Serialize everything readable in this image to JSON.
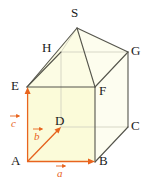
{
  "figure": {
    "colors": {
      "face_fill": "#fbfbdc",
      "face_fill_light": "#fdfdef",
      "edge_dark": "#4a4a42",
      "edge_hidden": "#cfcfc0",
      "vector": "#e8641e",
      "vector_edge": "#e0701c",
      "label": "#1a1a1a",
      "background": "#ffffff"
    },
    "vertices": [
      {
        "name": "A",
        "x": 27,
        "y": 162,
        "label_x": 11,
        "label_y": 155,
        "hidden": false
      },
      {
        "name": "B",
        "x": 95,
        "y": 162,
        "label_x": 99,
        "label_y": 155,
        "hidden": false
      },
      {
        "name": "C",
        "x": 128,
        "y": 127,
        "label_x": 131,
        "label_y": 120,
        "hidden": false
      },
      {
        "name": "D",
        "x": 61,
        "y": 127,
        "label_x": 55,
        "label_y": 116,
        "hidden": true
      },
      {
        "name": "E",
        "x": 27,
        "y": 87,
        "label_x": 11,
        "label_y": 80,
        "hidden": false
      },
      {
        "name": "F",
        "x": 95,
        "y": 87,
        "label_x": 99,
        "label_y": 85,
        "hidden": false
      },
      {
        "name": "G",
        "x": 128,
        "y": 52,
        "label_x": 131,
        "label_y": 45,
        "hidden": false
      },
      {
        "name": "H",
        "x": 61,
        "y": 52,
        "label_x": 43,
        "label_y": 42,
        "hidden": false
      },
      {
        "name": "S",
        "x": 77,
        "y": 28,
        "label_x": 72,
        "label_y": 8,
        "hidden": false
      }
    ],
    "vectors": [
      {
        "name": "a",
        "label": "a",
        "from": "A",
        "to": "B",
        "x1": 28,
        "y1": 161,
        "x2": 93,
        "y2": 161,
        "label_x": 56,
        "label_y": 172
      },
      {
        "name": "b",
        "label": "b",
        "from": "A",
        "to": "D",
        "x1": 28,
        "y1": 161,
        "x2": 60,
        "y2": 128,
        "label_x": 32,
        "label_y": 135
      },
      {
        "name": "c",
        "label": "c",
        "from": "A",
        "to": "E",
        "x1": 28,
        "y1": 161,
        "x2": 28,
        "y2": 89,
        "label_x": 13,
        "label_y": 122
      }
    ],
    "edges": [
      {
        "from": "A",
        "to": "B",
        "style": "vector"
      },
      {
        "from": "B",
        "to": "C",
        "style": "solid"
      },
      {
        "from": "A",
        "to": "E",
        "style": "vector"
      },
      {
        "from": "B",
        "to": "F",
        "style": "solid"
      },
      {
        "from": "C",
        "to": "G",
        "style": "solid"
      },
      {
        "from": "D",
        "to": "H",
        "style": "hidden"
      },
      {
        "from": "A",
        "to": "D",
        "style": "hidden"
      },
      {
        "from": "D",
        "to": "C",
        "style": "hidden"
      },
      {
        "from": "E",
        "to": "F",
        "style": "solid"
      },
      {
        "from": "F",
        "to": "G",
        "style": "solid"
      },
      {
        "from": "E",
        "to": "H",
        "style": "solid"
      },
      {
        "from": "H",
        "to": "G",
        "style": "hidden"
      },
      {
        "from": "E",
        "to": "S",
        "style": "solid"
      },
      {
        "from": "F",
        "to": "S",
        "style": "solid"
      },
      {
        "from": "G",
        "to": "S",
        "style": "solid"
      },
      {
        "from": "H",
        "to": "S",
        "style": "hidden"
      }
    ]
  }
}
